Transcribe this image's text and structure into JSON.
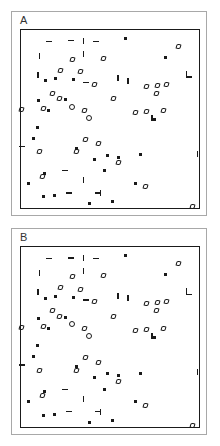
{
  "figure": {
    "panel_a_label": "A",
    "panel_b_label": "B",
    "frame_color": "#a8a8a8",
    "axis_color": "#1a1a1a",
    "marker_color": "#1a1a1a",
    "background_color": "#ffffff"
  },
  "chart_data": [
    {
      "type": "scatter",
      "title": "A",
      "xlabel": "",
      "ylabel": "",
      "xlim": [
        0,
        100
      ],
      "ylim": [
        0,
        100
      ],
      "grid": false,
      "legend": "none",
      "axis_ticks": "none",
      "series": [
        {
          "name": "filled-square",
          "marker": "square-filled",
          "points": [
            [
              58.5,
              4.5
            ],
            [
              13.5,
              28.5
            ],
            [
              19.5,
              27.5
            ],
            [
              29.5,
              28.0
            ],
            [
              10.0,
              39.5
            ],
            [
              15.5,
              45.0
            ],
            [
              25.0,
              39.0
            ],
            [
              9.5,
              54.5
            ],
            [
              7.0,
              61.0
            ],
            [
              31.0,
              66.5
            ],
            [
              41.5,
              72.5
            ],
            [
              48.5,
              70.5
            ],
            [
              55.0,
              71.5
            ],
            [
              67.0,
              70.0
            ],
            [
              47.0,
              79.0
            ],
            [
              13.0,
              80.5
            ],
            [
              4.0,
              86.0
            ],
            [
              12.5,
              93.5
            ],
            [
              19.0,
              93.0
            ],
            [
              38.5,
              97.5
            ],
            [
              51.5,
              96.5
            ],
            [
              64.5,
              86.0
            ],
            [
              81.0,
              15.5
            ],
            [
              75.0,
              50.5
            ]
          ]
        },
        {
          "name": "open-diamond",
          "marker": "diamond-open",
          "points": [
            [
              29.0,
              16.5
            ],
            [
              46.5,
              16.0
            ],
            [
              88.5,
              9.0
            ],
            [
              22.0,
              22.5
            ],
            [
              33.5,
              23.5
            ],
            [
              41.5,
              30.5
            ],
            [
              17.5,
              35.5
            ],
            [
              21.5,
              38.5
            ],
            [
              12.5,
              44.0
            ],
            [
              70.5,
              31.5
            ],
            [
              76.5,
              31.0
            ],
            [
              82.0,
              30.5
            ],
            [
              76.0,
              35.5
            ],
            [
              0.5,
              44.5
            ],
            [
              35.5,
              45.5
            ],
            [
              52.0,
              38.5
            ],
            [
              64.5,
              46.5
            ],
            [
              70.5,
              46.0
            ],
            [
              80.0,
              45.5
            ],
            [
              36.5,
              61.5
            ],
            [
              31.0,
              68.5
            ],
            [
              43.5,
              64.0
            ],
            [
              54.5,
              74.5
            ],
            [
              10.5,
              68.5
            ],
            [
              12.0,
              82.5
            ],
            [
              70.0,
              88.0
            ],
            [
              96.5,
              99.0
            ]
          ]
        },
        {
          "name": "circle-open",
          "marker": "circle-open",
          "points": [
            [
              38.0,
              49.5
            ],
            [
              28.5,
              43.0
            ]
          ]
        },
        {
          "name": "vertical-bar",
          "marker": "bar-vertical",
          "points": [
            [
              10.5,
              14.5
            ],
            [
              9.5,
              25.0
            ],
            [
              54.5,
              27.0
            ],
            [
              60.0,
              28.5
            ],
            [
              93.0,
              24.5
            ],
            [
              73.5,
              49.5
            ],
            [
              99.0,
              69.5
            ],
            [
              35.0,
              84.5
            ],
            [
              44.5,
              91.5
            ],
            [
              35.0,
              6.0
            ],
            [
              35.0,
              13.5
            ]
          ]
        },
        {
          "name": "horizontal-dash",
          "marker": "dash-horizontal",
          "points": [
            [
              15.5,
              6.5
            ],
            [
              28.0,
              6.0
            ],
            [
              42.0,
              6.5
            ],
            [
              36.5,
              29.5
            ],
            [
              0.5,
              65.5
            ],
            [
              24.5,
              79.0
            ],
            [
              94.5,
              26.5
            ],
            [
              27.0,
              91.5
            ],
            [
              43.0,
              91.5
            ]
          ]
        }
      ]
    },
    {
      "type": "scatter",
      "title": "B",
      "xlabel": "",
      "ylabel": "",
      "xlim": [
        0,
        100
      ],
      "ylim": [
        0,
        100
      ],
      "grid": false,
      "legend": "none",
      "axis_ticks": "none",
      "series": [
        {
          "name": "filled-square",
          "marker": "square-filled",
          "points": [
            [
              58.5,
              4.5
            ],
            [
              13.5,
              28.5
            ],
            [
              19.5,
              27.5
            ],
            [
              29.5,
              28.0
            ],
            [
              10.0,
              39.5
            ],
            [
              15.5,
              45.0
            ],
            [
              25.0,
              39.0
            ],
            [
              9.5,
              54.5
            ],
            [
              7.0,
              61.0
            ],
            [
              31.0,
              66.5
            ],
            [
              41.5,
              72.5
            ],
            [
              48.5,
              70.5
            ],
            [
              55.0,
              71.5
            ],
            [
              67.0,
              70.0
            ],
            [
              47.0,
              79.0
            ],
            [
              13.0,
              80.5
            ],
            [
              4.0,
              86.0
            ],
            [
              12.5,
              93.5
            ],
            [
              19.0,
              93.0
            ],
            [
              38.5,
              97.5
            ],
            [
              51.5,
              96.5
            ],
            [
              64.5,
              86.0
            ],
            [
              81.0,
              15.5
            ],
            [
              75.0,
              50.5
            ]
          ]
        },
        {
          "name": "open-diamond",
          "marker": "diamond-open",
          "points": [
            [
              29.0,
              16.5
            ],
            [
              46.5,
              16.0
            ],
            [
              88.5,
              9.0
            ],
            [
              22.0,
              22.5
            ],
            [
              33.5,
              23.5
            ],
            [
              41.5,
              30.5
            ],
            [
              17.5,
              35.5
            ],
            [
              21.5,
              38.5
            ],
            [
              12.5,
              44.0
            ],
            [
              70.5,
              31.5
            ],
            [
              76.5,
              31.0
            ],
            [
              82.0,
              30.5
            ],
            [
              76.0,
              35.5
            ],
            [
              0.5,
              44.5
            ],
            [
              35.5,
              45.5
            ],
            [
              52.0,
              38.5
            ],
            [
              64.5,
              46.5
            ],
            [
              70.5,
              46.0
            ],
            [
              80.0,
              45.5
            ],
            [
              36.5,
              61.5
            ],
            [
              31.0,
              68.5
            ],
            [
              43.5,
              64.0
            ],
            [
              54.5,
              74.5
            ],
            [
              10.5,
              68.5
            ],
            [
              12.0,
              82.5
            ],
            [
              70.0,
              88.0
            ],
            [
              96.5,
              99.0
            ]
          ]
        },
        {
          "name": "circle-open",
          "marker": "circle-open",
          "points": [
            [
              38.0,
              49.5
            ],
            [
              28.5,
              43.0
            ]
          ]
        },
        {
          "name": "vertical-bar",
          "marker": "bar-vertical",
          "points": [
            [
              10.5,
              14.5
            ],
            [
              9.5,
              25.0
            ],
            [
              54.5,
              27.0
            ],
            [
              60.0,
              28.5
            ],
            [
              93.0,
              24.5
            ],
            [
              73.5,
              49.5
            ],
            [
              99.0,
              69.5
            ],
            [
              35.0,
              84.5
            ],
            [
              44.5,
              91.5
            ],
            [
              35.0,
              6.0
            ],
            [
              35.0,
              13.5
            ]
          ]
        },
        {
          "name": "horizontal-dash",
          "marker": "dash-horizontal",
          "points": [
            [
              15.5,
              6.5
            ],
            [
              28.0,
              6.0
            ],
            [
              42.0,
              6.5
            ],
            [
              36.5,
              29.5
            ],
            [
              0.5,
              65.5
            ],
            [
              24.5,
              79.0
            ],
            [
              94.5,
              26.5
            ],
            [
              27.0,
              91.5
            ],
            [
              43.0,
              91.5
            ]
          ]
        }
      ]
    }
  ]
}
